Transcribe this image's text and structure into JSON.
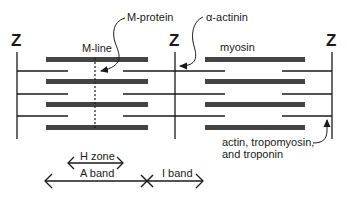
{
  "labels": {
    "z_left": "Z",
    "z_middle": "Z",
    "z_right": "Z",
    "m_protein": "M-protein",
    "alpha_actinin": "α-actinin",
    "m_line": "M-line",
    "myosin": "myosin",
    "thin_filament_line1": "actin, tropomyosin,",
    "thin_filament_line2": "and troponin",
    "h_zone": "H zone",
    "a_band": "A band",
    "i_band": "I band"
  },
  "colors": {
    "thick_filament": "#444444",
    "line": "#1a1a1a",
    "background": "#ffffff"
  }
}
